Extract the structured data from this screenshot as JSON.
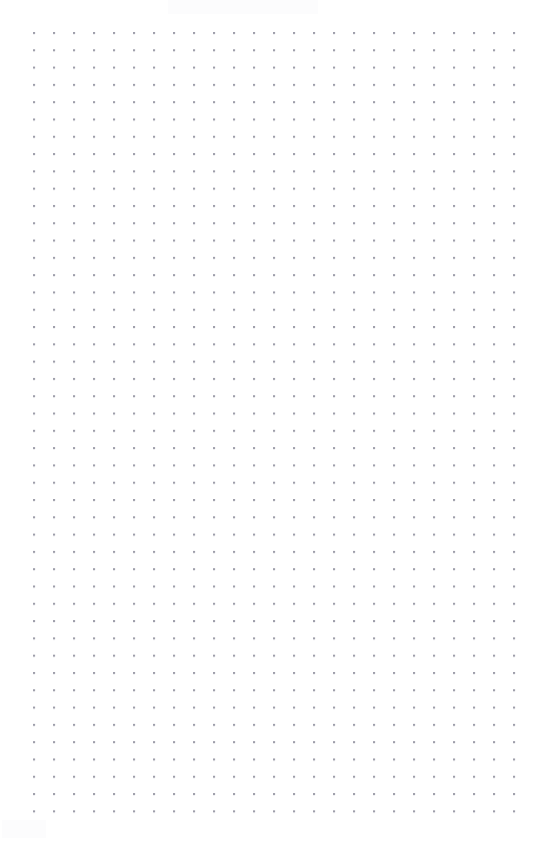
{
  "canvas": {
    "name": "dot-grid-canvas",
    "width": 543,
    "height": 841,
    "background_color": "#ffffff",
    "content": "",
    "is_empty": true
  },
  "grid": {
    "style": "dots",
    "dot_color": "#9696a3",
    "dot_radius_px": 1,
    "spacing_x_px": 20,
    "spacing_y_px": 17.3,
    "origin_x_px": 34,
    "origin_y_px": 33,
    "columns": 25,
    "rows": 46,
    "margin_left_px": 34,
    "margin_top_px": 33,
    "margin_right_px": 29,
    "margin_bottom_px": 33
  },
  "artifacts": {
    "top_smudge_color": "#fcfcfd",
    "bottom_left_smudge_color": "#fcfcfd"
  }
}
